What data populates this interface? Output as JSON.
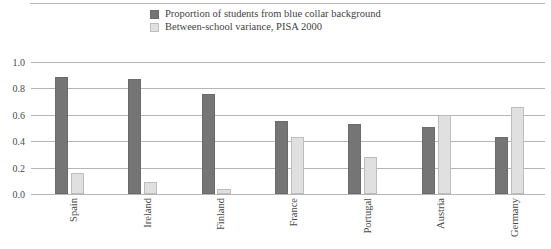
{
  "legend": {
    "position": "top-center",
    "entries": [
      {
        "label": "Proportion of students from blue collar background",
        "color": "#757575",
        "swatch_name": "legend-swatch-dark"
      },
      {
        "label": "Between-school variance, PISA 2000",
        "color": "#e0e0e0",
        "swatch_name": "legend-swatch-light"
      }
    ]
  },
  "axis": {
    "y_ticks": [
      "1.0",
      "0.8",
      "0.6",
      "0.4",
      "0.2",
      "0.0"
    ]
  },
  "chart_data": {
    "type": "bar",
    "title": "",
    "subtitle": "",
    "xlabel": "",
    "ylabel": "",
    "ylim": [
      0.0,
      1.0
    ],
    "grid": true,
    "legend_position": "top-center",
    "categories": [
      "Spain",
      "Ireland",
      "Finland",
      "France",
      "Portugal",
      "Austria",
      "Germany"
    ],
    "series": [
      {
        "name": "Proportion of students from blue collar background",
        "color": "#757575",
        "values": [
          0.89,
          0.87,
          0.76,
          0.55,
          0.53,
          0.51,
          0.43
        ]
      },
      {
        "name": "Between-school variance, PISA 2000",
        "color": "#e0e0e0",
        "values": [
          0.16,
          0.09,
          0.04,
          0.43,
          0.28,
          0.6,
          0.66
        ]
      }
    ]
  }
}
